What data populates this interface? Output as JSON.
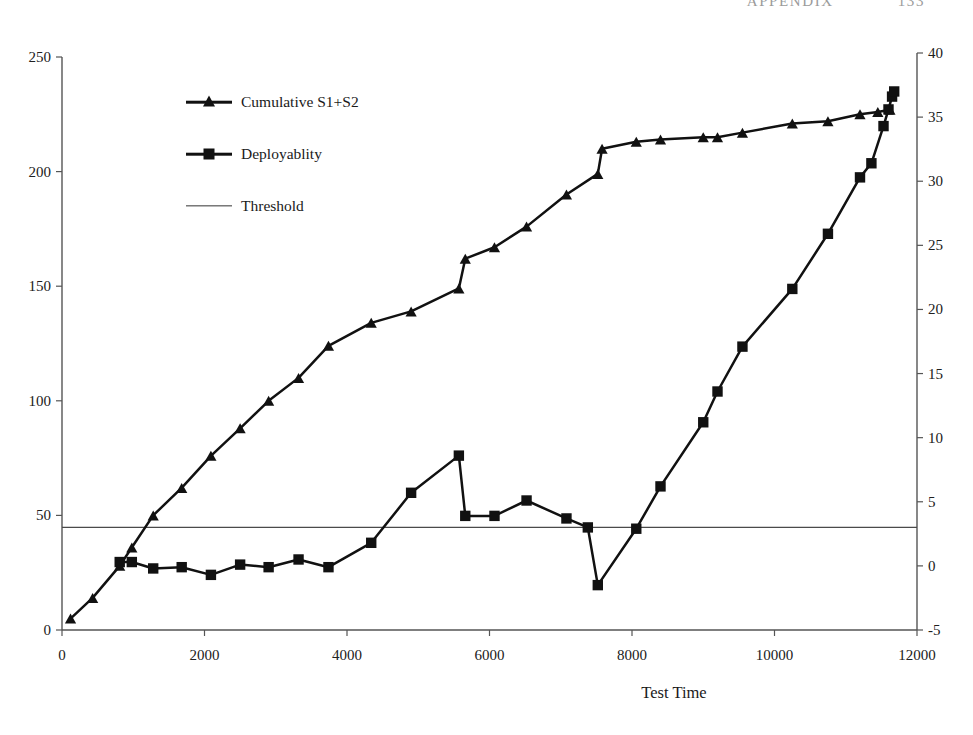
{
  "page_header": {
    "left_text": "APPENDIX",
    "right_text": "133"
  },
  "legend": {
    "position": "inside-top-left",
    "items": [
      {
        "label": "Cumulative S1+S2",
        "marker": "triangle",
        "key": "cumulative"
      },
      {
        "label": "Deployablity",
        "marker": "square",
        "key": "deployability"
      },
      {
        "label": "Threshold",
        "marker": "line",
        "key": "threshold"
      }
    ]
  },
  "chart_data": {
    "type": "line",
    "title": "",
    "subtitle": "",
    "xlabel": "Test Time",
    "ylabel": "",
    "y2label": "",
    "grid": false,
    "xlim": [
      0,
      12000
    ],
    "ylim": [
      0,
      250
    ],
    "y2lim": [
      -5,
      40
    ],
    "xticks": [
      0,
      2000,
      4000,
      6000,
      8000,
      10000,
      12000
    ],
    "xticklabels": [
      "0",
      "2000",
      "4000",
      "6000",
      "8000",
      "10000",
      "12000"
    ],
    "yticks": [
      0,
      50,
      100,
      150,
      200,
      250
    ],
    "yticklabels": [
      "0",
      "50",
      "100",
      "150",
      "200",
      "250"
    ],
    "y2ticks": [
      -5,
      0,
      5,
      10,
      15,
      20,
      25,
      30,
      35,
      40
    ],
    "y2ticklabels": [
      "-5",
      "0",
      "5",
      "10",
      "15",
      "20",
      "25",
      "30",
      "35",
      "40"
    ],
    "threshold_value": 3,
    "threshold_axis": "right",
    "series": [
      {
        "name": "Cumulative S1+S2",
        "axis": "left",
        "marker": "triangle",
        "color": "#111111",
        "points": [
          [
            120,
            5
          ],
          [
            430,
            14
          ],
          [
            810,
            28
          ],
          [
            980,
            36
          ],
          [
            1280,
            50
          ],
          [
            1680,
            62
          ],
          [
            2090,
            76
          ],
          [
            2500,
            88
          ],
          [
            2900,
            100
          ],
          [
            3320,
            110
          ],
          [
            3740,
            124
          ],
          [
            4340,
            134
          ],
          [
            4900,
            139
          ],
          [
            5570,
            149
          ],
          [
            5660,
            162
          ],
          [
            6070,
            167
          ],
          [
            6520,
            176
          ],
          [
            7080,
            190
          ],
          [
            7520,
            199
          ],
          [
            7580,
            210
          ],
          [
            8060,
            213
          ],
          [
            8400,
            214
          ],
          [
            9000,
            215
          ],
          [
            9200,
            215
          ],
          [
            9550,
            217
          ],
          [
            10250,
            221
          ],
          [
            10750,
            222
          ],
          [
            11200,
            225
          ],
          [
            11450,
            226
          ],
          [
            11620,
            227
          ]
        ]
      },
      {
        "name": "Deployablity",
        "axis": "right",
        "marker": "square",
        "color": "#111111",
        "points": [
          [
            810,
            0.3
          ],
          [
            980,
            0.3
          ],
          [
            1280,
            -0.2
          ],
          [
            1680,
            -0.1
          ],
          [
            2090,
            -0.7
          ],
          [
            2500,
            0.1
          ],
          [
            2900,
            -0.1
          ],
          [
            3320,
            0.5
          ],
          [
            3740,
            -0.1
          ],
          [
            4340,
            1.8
          ],
          [
            4900,
            5.7
          ],
          [
            5570,
            8.6
          ],
          [
            5660,
            3.9
          ],
          [
            6070,
            3.9
          ],
          [
            6520,
            5.1
          ],
          [
            7080,
            3.7
          ],
          [
            7380,
            3.0
          ],
          [
            7520,
            -1.5
          ],
          [
            8060,
            2.9
          ],
          [
            8400,
            6.2
          ],
          [
            9000,
            11.2
          ],
          [
            9200,
            13.6
          ],
          [
            9550,
            17.1
          ],
          [
            10250,
            21.6
          ],
          [
            10750,
            25.9
          ],
          [
            11200,
            30.3
          ],
          [
            11360,
            31.4
          ],
          [
            11530,
            34.3
          ],
          [
            11600,
            35.6
          ],
          [
            11650,
            36.6
          ],
          [
            11680,
            37.0
          ]
        ]
      }
    ]
  }
}
